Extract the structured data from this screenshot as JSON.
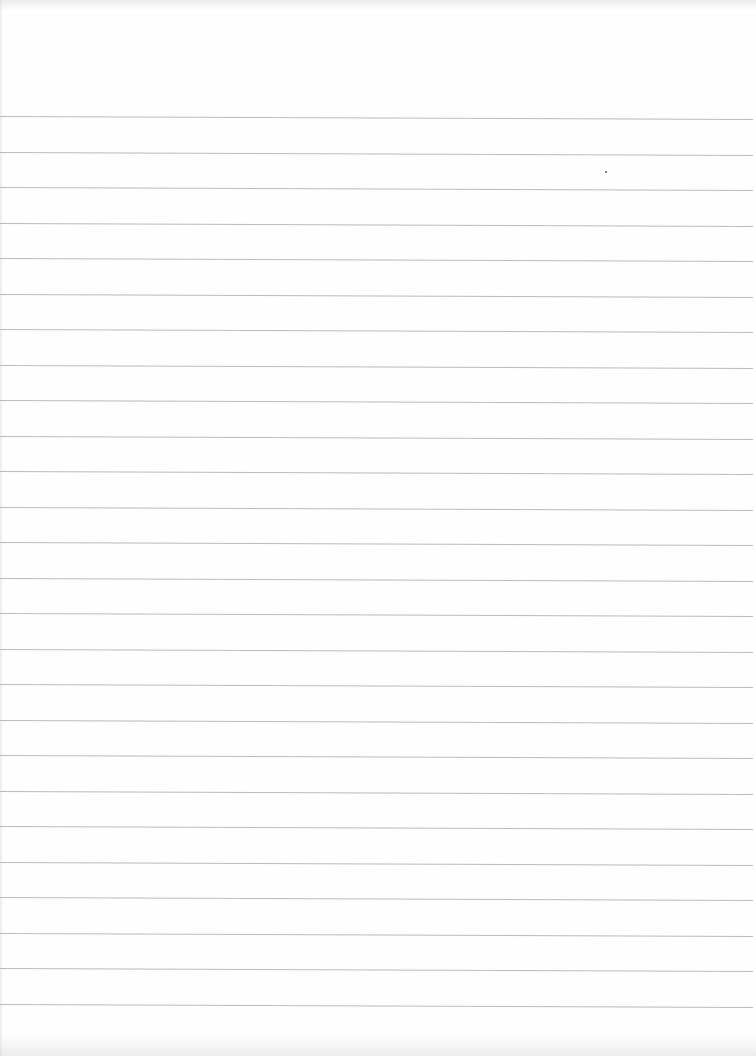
{
  "document": {
    "type": "ruled-paper",
    "description": "Blank lined notebook sheet",
    "content_text": ""
  },
  "rules": {
    "count": 26,
    "first_y": 116,
    "spacing": 35.5,
    "color": "#b4b4b4",
    "paper_color": "#fefefe"
  },
  "marks": [
    {
      "name": "speck",
      "x": 605,
      "y": 171
    }
  ]
}
